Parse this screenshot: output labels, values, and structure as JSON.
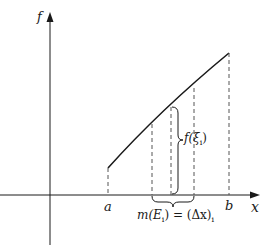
{
  "figure": {
    "type": "lebesgue-partition-diagram",
    "axes": {
      "y_label": "f",
      "x_label": "x"
    },
    "ticks": {
      "a": "a",
      "b": "b"
    },
    "annotations": {
      "height_label": "f(ξ",
      "height_sub": "i",
      "height_close": ")",
      "measure_label": "m(E",
      "measure_sub": "i",
      "measure_mid": ") = (Δx)",
      "measure_sub2": "i"
    },
    "colors": {
      "stroke": "#1a1a1a",
      "dashed": "#555555",
      "background": "#ffffff"
    }
  }
}
